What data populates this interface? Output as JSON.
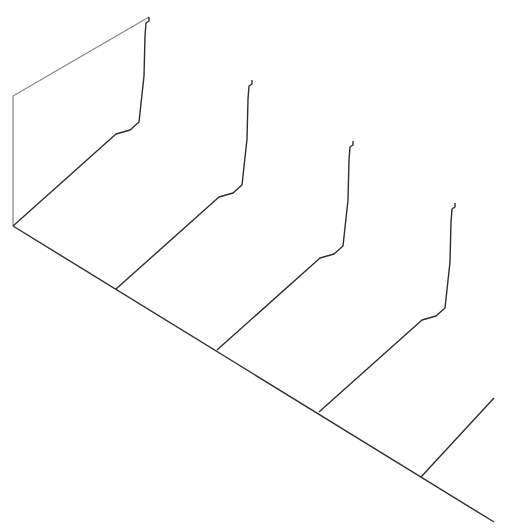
{
  "diagram": {
    "type": "waterfall-profiles",
    "colors": {
      "profile_line": "#2e2e2e",
      "frame_edge": "#8a8a8a",
      "background": "#ffffff"
    },
    "profile_count": 5,
    "profiles": [
      {
        "id": "profile-1",
        "index": 0,
        "complete": true,
        "has_back_frame": true
      },
      {
        "id": "profile-2",
        "index": 1,
        "complete": true,
        "has_back_frame": false
      },
      {
        "id": "profile-3",
        "index": 2,
        "complete": true,
        "has_back_frame": false
      },
      {
        "id": "profile-4",
        "index": 3,
        "complete": true,
        "has_back_frame": false
      },
      {
        "id": "profile-5",
        "index": 4,
        "complete": false,
        "has_back_frame": false
      }
    ]
  }
}
